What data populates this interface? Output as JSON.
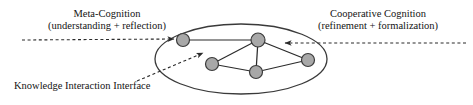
{
  "diagram": {
    "colors": {
      "node_fill": "#a8a8a8",
      "node_stroke": "#3b3b3b",
      "edge": "#2b2b2b",
      "ellipse_stroke": "#3a3a3a",
      "dashed": "#2b2b2b",
      "text": "#141414",
      "background": "#ffffff"
    },
    "labels": {
      "meta_cognition": {
        "line1": "Meta-Cognition",
        "line2": "(understanding + reflection)"
      },
      "cooperative_cognition": {
        "line1": "Cooperative Cognition",
        "line2": "(refinement + formalization)"
      },
      "knowledge_interaction_interface": {
        "line1": "Knowledge Interaction Interface"
      }
    },
    "ellipse": {
      "cx": 241,
      "cy": 59,
      "rx": 86,
      "ry": 35
    },
    "nodes": [
      {
        "id": "n1",
        "name": "node-top-left",
        "cx": 183,
        "cy": 40,
        "r": 6.5
      },
      {
        "id": "n2",
        "name": "node-top-center",
        "cx": 258,
        "cy": 40,
        "r": 7.0
      },
      {
        "id": "n3",
        "name": "node-bottom-left",
        "cx": 212,
        "cy": 64,
        "r": 6.5
      },
      {
        "id": "n4",
        "name": "node-bottom-center",
        "cx": 256,
        "cy": 72,
        "r": 6.5
      },
      {
        "id": "n5",
        "name": "node-right",
        "cx": 308,
        "cy": 60,
        "r": 6.5
      }
    ],
    "edges": [
      {
        "from": "n1",
        "to": "n2",
        "name": "edge-topleft-topcenter"
      },
      {
        "from": "n2",
        "to": "n3",
        "name": "edge-topcenter-bottomleft"
      },
      {
        "from": "n2",
        "to": "n4",
        "name": "edge-topcenter-bottomcenter"
      },
      {
        "from": "n2",
        "to": "n5",
        "name": "edge-topcenter-right"
      },
      {
        "from": "n3",
        "to": "n4",
        "name": "edge-bottomleft-bottomcenter"
      },
      {
        "from": "n4",
        "to": "n5",
        "name": "edge-bottomcenter-right"
      }
    ],
    "annotations": [
      {
        "name": "meta-cognition-arrow",
        "style": "dashed",
        "from_x": 22,
        "from_y": 40,
        "to_x": 174,
        "to_y": 39,
        "arrow_at": "end"
      },
      {
        "name": "cooperative-cognition-arrow",
        "style": "dashed",
        "from_x": 466,
        "from_y": 43,
        "to_x": 285,
        "to_y": 43,
        "arrow_at": "end"
      },
      {
        "name": "knowledge-interface-leader",
        "style": "dashed",
        "from_x": 137,
        "from_y": 81,
        "to_x": 203,
        "to_y": 53,
        "arrow_at": "end"
      }
    ]
  }
}
